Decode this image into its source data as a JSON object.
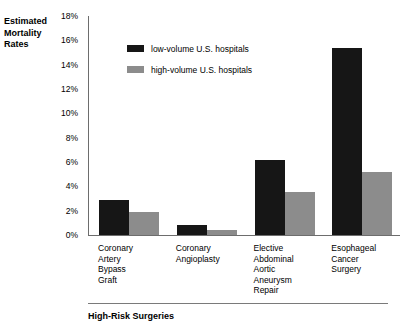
{
  "chart_data": {
    "type": "bar",
    "title": "",
    "xlabel": "High-Risk Surgeries",
    "ylabel": "Estimated Mortality Rates",
    "ylim": [
      0,
      18
    ],
    "ytick_labels": [
      "18%",
      "16%",
      "14%",
      "12%",
      "10%",
      "8%",
      "6%",
      "4%",
      "2%",
      "0%"
    ],
    "ytick_values": [
      18,
      16,
      14,
      12,
      10,
      8,
      6,
      4,
      2,
      0
    ],
    "grid": false,
    "legend_position": "top-left-inside",
    "categories": [
      "Coronary\nArtery\nBypass\nGraft",
      "Coronary\nAngioplasty",
      "Elective\nAbdominal\nAortic\nAneurysm\nRepair",
      "Esophageal\nCancer\nSurgery"
    ],
    "series": [
      {
        "name": "low-volume U.S. hospitals",
        "color": "#161616",
        "values": [
          2.9,
          0.8,
          6.2,
          15.4
        ]
      },
      {
        "name": "high-volume U.S. hospitals",
        "color": "#8c8c8c",
        "values": [
          1.9,
          0.4,
          3.5,
          5.2
        ]
      }
    ],
    "value_unit": "%"
  }
}
